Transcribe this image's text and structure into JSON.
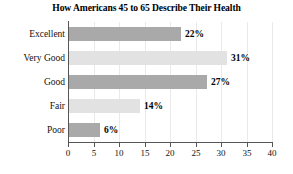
{
  "chart_data": {
    "type": "bar",
    "orientation": "horizontal",
    "title": "How Americans 45 to 65 Describe Their Health",
    "xlabel": "",
    "ylabel": "",
    "categories": [
      "Excellent",
      "Very Good",
      "Good",
      "Fair",
      "Poor"
    ],
    "values": [
      22,
      31,
      27,
      14,
      6
    ],
    "value_labels": [
      "22%",
      "31%",
      "27%",
      "14%",
      "6%"
    ],
    "xlim": [
      0,
      40
    ],
    "xticks": [
      0,
      5,
      10,
      15,
      20,
      25,
      30,
      35,
      40
    ],
    "xtick_labels": [
      "0",
      "5",
      "10",
      "15",
      "20",
      "25",
      "30",
      "35",
      "40"
    ],
    "grid": true,
    "legend": false,
    "bar_colors": [
      "#a9a9a9",
      "#e2e2e2",
      "#a9a9a9",
      "#e2e2e2",
      "#a9a9a9"
    ],
    "axis_color": "#555555",
    "text_color": "#111111"
  }
}
